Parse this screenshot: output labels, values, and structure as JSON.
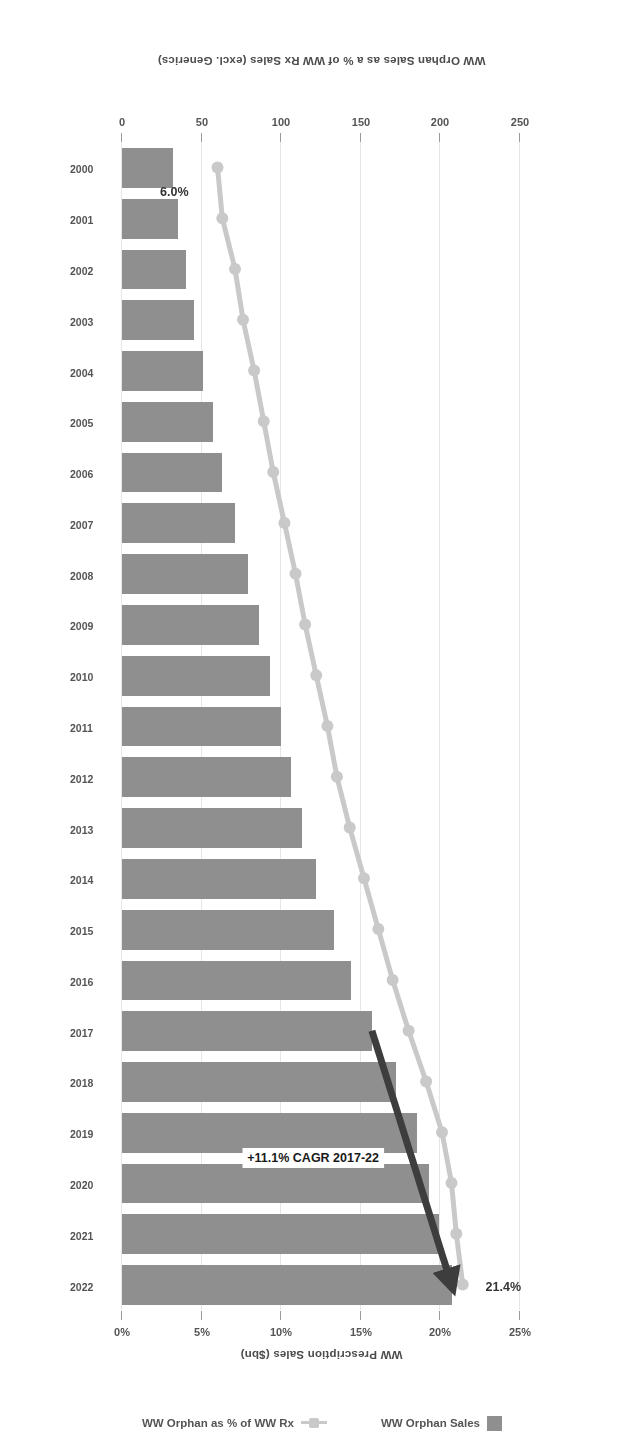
{
  "chart_data": {
    "type": "bar",
    "title": "",
    "subtitle": "",
    "orientation": "horizontal-rotated-180",
    "categories": [
      "2000",
      "2001",
      "2002",
      "2003",
      "2004",
      "2005",
      "2006",
      "2007",
      "2008",
      "2009",
      "2010",
      "2011",
      "2012",
      "2013",
      "2014",
      "2015",
      "2016",
      "2017",
      "2018",
      "2019",
      "2020",
      "2021",
      "2022"
    ],
    "xlabel": "",
    "ylabel": "WW Prescription Sales ($bn)",
    "y2label": "WW Orphan Sales as a % of WW Rx Sales (excl. Generics)",
    "ylim": [
      0,
      250
    ],
    "y2lim": [
      0,
      25
    ],
    "ytick_labels": [
      "0",
      "50",
      "100",
      "150",
      "200",
      "250"
    ],
    "ytick_values": [
      0,
      50,
      100,
      150,
      200,
      250
    ],
    "y2tick_labels": [
      "0%",
      "5%",
      "10%",
      "15%",
      "20%",
      "25%"
    ],
    "y2tick_values": [
      0,
      5,
      10,
      15,
      20,
      25
    ],
    "grid": true,
    "legend_position": "bottom-center",
    "series": [
      {
        "name": "WW Orphan Sales",
        "type": "bar",
        "axis": "left",
        "unit": "$bn",
        "color": "#8f8f8f",
        "values": [
          32,
          35,
          40,
          45,
          51,
          57,
          63,
          71,
          79,
          86,
          93,
          100,
          106,
          113,
          122,
          133,
          144,
          157,
          172,
          185,
          193,
          199,
          207
        ]
      },
      {
        "name": "WW Orphan as % of WW Rx",
        "type": "line",
        "axis": "right",
        "unit": "%",
        "color": "#c9c9c9",
        "values": [
          6.0,
          6.3,
          7.1,
          7.6,
          8.3,
          8.9,
          9.5,
          10.2,
          10.9,
          11.5,
          12.2,
          12.9,
          13.5,
          14.3,
          15.2,
          16.1,
          17.0,
          18.0,
          19.1,
          20.1,
          20.7,
          21.0,
          21.4
        ]
      }
    ],
    "annotations": [
      {
        "name": "cagr-callout",
        "text": "+11.1% CAGR 2017-22",
        "from_category": "2017",
        "to_category": "2022"
      },
      {
        "name": "line-end-label",
        "text": "21.4%",
        "category": "2022",
        "value": 21.4
      },
      {
        "name": "line-start-label",
        "text": "6.0%",
        "category": "2000",
        "value": 6.0
      }
    ]
  },
  "axes": {
    "value_axis_title": "WW Prescription Sales ($bn)",
    "percent_axis_title": "WW Orphan Sales as a % of WW Rx Sales (excl. Generics)"
  },
  "legend": {
    "items": [
      {
        "label": "WW Orphan Sales",
        "marker": "bar-swatch-icon",
        "color": "#8f8f8f"
      },
      {
        "label": "WW Orphan as % of WW Rx",
        "marker": "line-marker-icon",
        "color": "#c9c9c9"
      }
    ]
  }
}
